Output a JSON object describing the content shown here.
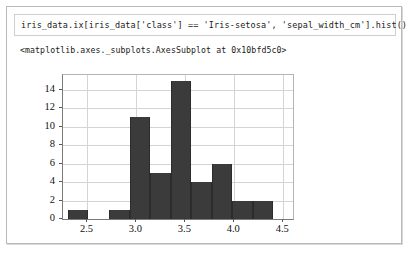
{
  "notebook": {
    "input": {
      "code": "iris_data.ix[iris_data['class'] == 'Iris-setosa', 'sepal_width_cm'].hist()"
    },
    "output": {
      "repr_text": "<matplotlib.axes._subplots.AxesSubplot at 0x10bfd5c0>"
    }
  },
  "chart_data": {
    "type": "bar",
    "title": "",
    "xlabel": "",
    "ylabel": "",
    "grid": true,
    "legend": false,
    "bar_color": "#3b3b3b",
    "background": "#ffffff",
    "xlim": [
      2.25,
      4.6
    ],
    "ylim": [
      0,
      15.6
    ],
    "xticks": [
      "2.5",
      "3.0",
      "3.5",
      "4.0",
      "4.5"
    ],
    "xtick_values": [
      2.5,
      3.0,
      3.5,
      4.0,
      4.5
    ],
    "yticks": [
      "0",
      "2",
      "4",
      "6",
      "8",
      "10",
      "12",
      "14"
    ],
    "ytick_values": [
      0,
      2,
      4,
      6,
      8,
      10,
      12,
      14
    ],
    "bin_edges": [
      2.3,
      2.51,
      2.72,
      2.93,
      3.14,
      3.35,
      3.56,
      3.77,
      3.98,
      4.19,
      4.4
    ],
    "values": [
      1,
      0,
      1,
      11,
      5,
      15,
      4,
      6,
      2,
      2
    ]
  }
}
